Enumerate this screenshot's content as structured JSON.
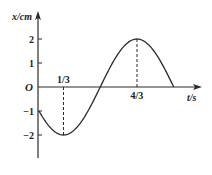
{
  "chart_data": {
    "type": "line",
    "title": "",
    "xlabel": "t/s",
    "ylabel": "x/cm",
    "origin_label": "O",
    "function": "x = 2 sin(pi*t - 5*pi/6)",
    "amplitude": 2,
    "period": 2,
    "x_range": [
      0,
      1.8333
    ],
    "ylim": [
      -2.9,
      3.1
    ],
    "y_ticks": [
      {
        "value": 2,
        "label": "2"
      },
      {
        "value": 1,
        "label": "1"
      },
      {
        "value": -1,
        "label": "-1"
      },
      {
        "value": -2,
        "label": "-2"
      }
    ],
    "x_ticks": [
      {
        "value": 0.3333,
        "label": "1/3"
      },
      {
        "value": 1.3333,
        "label": "4/3"
      }
    ],
    "key_points": [
      {
        "t": 0,
        "x": -1
      },
      {
        "t": 0.3333,
        "x": -2
      },
      {
        "t": 0.8333,
        "x": 0
      },
      {
        "t": 1.3333,
        "x": 2
      },
      {
        "t": 1.8333,
        "x": 0
      }
    ],
    "dashed_guides": [
      {
        "t": 0.3333,
        "x": -2
      },
      {
        "t": 1.3333,
        "x": 2
      }
    ],
    "grid": false,
    "legend": null
  },
  "style": {
    "line_color": "#2a2a2a",
    "axis_color": "#2a2a2a"
  }
}
